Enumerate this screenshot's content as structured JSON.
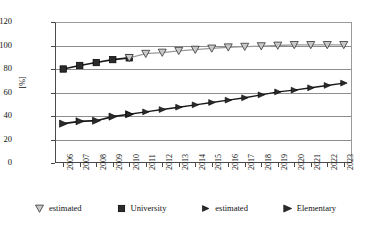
{
  "chart_data": {
    "type": "line",
    "title": "",
    "xlabel": "",
    "ylabel": "[%]",
    "ylim": [
      0,
      120
    ],
    "ytick_labels": [
      "0",
      "20",
      "40",
      "60",
      "80",
      "100",
      "120"
    ],
    "ytick_values": [
      0,
      20,
      40,
      60,
      80,
      100,
      120
    ],
    "grid": "horizontal",
    "legend_position": "bottom",
    "categories": [
      "2006",
      "2007",
      "2008",
      "2009",
      "2010",
      "2011",
      "2012",
      "2013",
      "2014",
      "2015",
      "2016",
      "2017",
      "2018",
      "2019",
      "2020",
      "2021",
      "2022",
      "2023"
    ],
    "series": [
      {
        "name": "University",
        "marker": "filled-square",
        "values": [
          80,
          83,
          85.5,
          88,
          89.5,
          null,
          null,
          null,
          null,
          null,
          null,
          null,
          null,
          null,
          null,
          null,
          null,
          null
        ]
      },
      {
        "name": "estimated",
        "marker": "open-down-triangle",
        "values": [
          null,
          null,
          null,
          null,
          89.5,
          93,
          94,
          95.5,
          96.5,
          97.5,
          98.5,
          99,
          99.5,
          100,
          100.5,
          100.5,
          100.5,
          100.5
        ]
      },
      {
        "name": "Elementary",
        "marker": "filled-right-triangle",
        "values": [
          33.5,
          35.5,
          36,
          39.5,
          41.5,
          null,
          null,
          null,
          null,
          null,
          null,
          null,
          null,
          null,
          null,
          null,
          null,
          null
        ]
      },
      {
        "name": "estimated",
        "marker": "filled-right-triangle-small",
        "values": [
          null,
          null,
          null,
          null,
          41.5,
          43.5,
          45.5,
          47.5,
          49.5,
          51.5,
          53.5,
          55.5,
          58,
          60.5,
          62,
          64,
          66,
          68
        ]
      }
    ]
  },
  "legend": {
    "items": [
      {
        "label": "estimated",
        "marker": "open-down-triangle-icon"
      },
      {
        "label": "University",
        "marker": "filled-square-icon"
      },
      {
        "label": "estimated",
        "marker": "filled-right-triangle-small-icon"
      },
      {
        "label": "Elementary",
        "marker": "filled-right-triangle-icon"
      }
    ]
  },
  "colors": {
    "axis": "#4a4a4a",
    "grid": "#8d8d8d",
    "upper_line": "#9a9a9a",
    "upper_solid_line": "#1a1a1a",
    "lower_line": "#1a1a1a",
    "marker_fill_dark": "#2b2b2b",
    "marker_fill_light": "#c9c9c9",
    "text": "#111111"
  }
}
